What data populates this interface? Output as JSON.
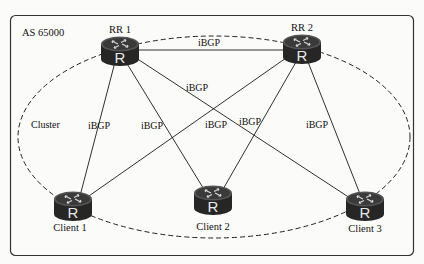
{
  "diagram": {
    "as_label": "AS 65000",
    "cluster_label": "Cluster",
    "router_glyph": "R",
    "nodes": {
      "rr1": {
        "label": "RR 1",
        "x": 120,
        "y": 50
      },
      "rr2": {
        "label": "RR 2",
        "x": 302,
        "y": 48
      },
      "client1": {
        "label": "Client 1",
        "x": 73,
        "y": 205
      },
      "client2": {
        "label": "Client 2",
        "x": 213,
        "y": 199
      },
      "client3": {
        "label": "Client 3",
        "x": 365,
        "y": 205
      }
    },
    "links": [
      {
        "from": "RR 1",
        "to": "RR 2",
        "label": "iBGP"
      },
      {
        "from": "RR 1",
        "to": "Client 1",
        "label": "iBGP"
      },
      {
        "from": "RR 1",
        "to": "Client 2",
        "label": "iBGP"
      },
      {
        "from": "RR 1",
        "to": "Client 3",
        "label": "iBGP"
      },
      {
        "from": "RR 2",
        "to": "Client 1",
        "label": "iBGP"
      },
      {
        "from": "RR 2",
        "to": "Client 2",
        "label": "iBGP"
      },
      {
        "from": "RR 2",
        "to": "Client 3",
        "label": "iBGP"
      }
    ],
    "link_label": "iBGP",
    "colors": {
      "router_body": "#2b2b2b",
      "router_top": "#4a4a4a",
      "line": "#1a1a1a",
      "background": "#fbfbf9"
    }
  }
}
